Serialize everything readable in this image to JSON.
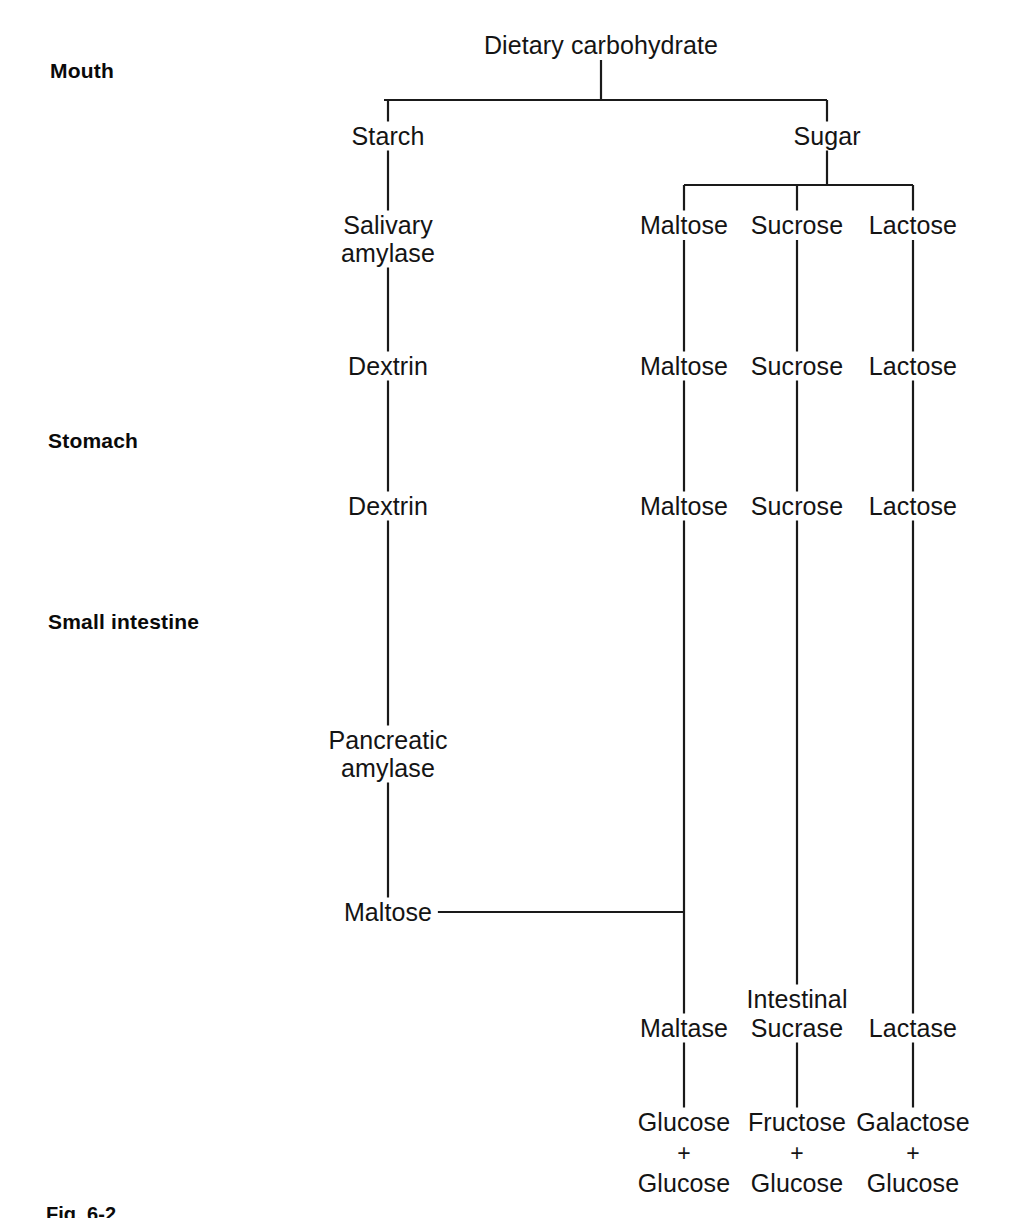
{
  "figure": {
    "caption": "Fig. 6-2"
  },
  "region_labels": [
    {
      "id": "mouth",
      "label": "Mouth",
      "x": 50,
      "y": 71
    },
    {
      "id": "stomach",
      "label": "Stomach",
      "x": 48,
      "y": 441
    },
    {
      "id": "small-intestine",
      "label": "Small intestine",
      "x": 48,
      "y": 622
    }
  ],
  "nodes": [
    {
      "id": "dietary-carbohydrate",
      "label": "Dietary carbohydrate",
      "x": 601,
      "y": 45
    },
    {
      "id": "starch",
      "label": "Starch",
      "x": 388,
      "y": 136
    },
    {
      "id": "sugar",
      "label": "Sugar",
      "x": 827,
      "y": 136
    },
    {
      "id": "salivary-amylase-1",
      "label": "Salivary",
      "x": 388,
      "y": 225
    },
    {
      "id": "salivary-amylase-2",
      "label": "amylase",
      "x": 388,
      "y": 253
    },
    {
      "id": "sugar-maltose-1",
      "label": "Maltose",
      "x": 684,
      "y": 225
    },
    {
      "id": "sugar-sucrose-1",
      "label": "Sucrose",
      "x": 797,
      "y": 225
    },
    {
      "id": "sugar-lactose-1",
      "label": "Lactose",
      "x": 913,
      "y": 225
    },
    {
      "id": "dextrin-1",
      "label": "Dextrin",
      "x": 388,
      "y": 366
    },
    {
      "id": "sugar-maltose-2",
      "label": "Maltose",
      "x": 684,
      "y": 366
    },
    {
      "id": "sugar-sucrose-2",
      "label": "Sucrose",
      "x": 797,
      "y": 366
    },
    {
      "id": "sugar-lactose-2",
      "label": "Lactose",
      "x": 913,
      "y": 366
    },
    {
      "id": "dextrin-2",
      "label": "Dextrin",
      "x": 388,
      "y": 506
    },
    {
      "id": "sugar-maltose-3",
      "label": "Maltose",
      "x": 684,
      "y": 506
    },
    {
      "id": "sugar-sucrose-3",
      "label": "Sucrose",
      "x": 797,
      "y": 506
    },
    {
      "id": "sugar-lactose-3",
      "label": "Lactose",
      "x": 913,
      "y": 506
    },
    {
      "id": "pancreatic-amylase-1",
      "label": "Pancreatic",
      "x": 388,
      "y": 740
    },
    {
      "id": "pancreatic-amylase-2",
      "label": "amylase",
      "x": 388,
      "y": 768
    },
    {
      "id": "maltose-product",
      "label": "Maltose",
      "x": 388,
      "y": 912
    },
    {
      "id": "intestinal",
      "label": "Intestinal",
      "x": 797,
      "y": 999
    },
    {
      "id": "maltase",
      "label": "Maltase",
      "x": 684,
      "y": 1028
    },
    {
      "id": "sucrase",
      "label": "Sucrase",
      "x": 797,
      "y": 1028
    },
    {
      "id": "lactase",
      "label": "Lactase",
      "x": 913,
      "y": 1028
    },
    {
      "id": "glucose-1",
      "label": "Glucose",
      "x": 684,
      "y": 1122
    },
    {
      "id": "fructose",
      "label": "Fructose",
      "x": 797,
      "y": 1122
    },
    {
      "id": "galactose",
      "label": "Galactose",
      "x": 913,
      "y": 1122
    },
    {
      "id": "glucose-2",
      "label": "Glucose",
      "x": 684,
      "y": 1183
    },
    {
      "id": "glucose-3",
      "label": "Glucose",
      "x": 797,
      "y": 1183
    },
    {
      "id": "glucose-4",
      "label": "Glucose",
      "x": 913,
      "y": 1183
    }
  ],
  "plus_signs": [
    {
      "id": "plus-maltase",
      "symbol": "+",
      "x": 684,
      "y": 1153
    },
    {
      "id": "plus-sucrase",
      "symbol": "+",
      "x": 797,
      "y": 1153
    },
    {
      "id": "plus-lactase",
      "symbol": "+",
      "x": 913,
      "y": 1153
    }
  ],
  "connectors": [
    {
      "id": "root-stem",
      "type": "v",
      "x": 601,
      "y1": 60,
      "y2": 100
    },
    {
      "id": "root-split-bar",
      "type": "h",
      "y": 100,
      "x1": 384,
      "x2": 827
    },
    {
      "id": "starch-drop",
      "type": "v",
      "x": 388,
      "y1": 100,
      "y2": 122
    },
    {
      "id": "sugar-drop",
      "type": "v",
      "x": 827,
      "y1": 100,
      "y2": 122
    },
    {
      "id": "starch-to-salivary",
      "type": "v",
      "x": 388,
      "y1": 150,
      "y2": 211
    },
    {
      "id": "salivary-to-dextrin",
      "type": "v",
      "x": 388,
      "y1": 266,
      "y2": 352
    },
    {
      "id": "dextrin1-to-dextrin2",
      "type": "v",
      "x": 388,
      "y1": 380,
      "y2": 492
    },
    {
      "id": "dextrin2-to-pancreatic",
      "type": "v",
      "x": 388,
      "y1": 520,
      "y2": 726
    },
    {
      "id": "pancreatic-to-maltose",
      "type": "v",
      "x": 388,
      "y1": 782,
      "y2": 898
    },
    {
      "id": "sugar-stem",
      "type": "v",
      "x": 827,
      "y1": 150,
      "y2": 185
    },
    {
      "id": "sugar-split-bar",
      "type": "h",
      "y": 185,
      "x1": 684,
      "x2": 913
    },
    {
      "id": "maltose-drop",
      "type": "v",
      "x": 684,
      "y1": 185,
      "y2": 211
    },
    {
      "id": "sucrose-drop",
      "type": "v",
      "x": 797,
      "y1": 185,
      "y2": 211
    },
    {
      "id": "lactose-drop",
      "type": "v",
      "x": 913,
      "y1": 185,
      "y2": 211
    },
    {
      "id": "maltose-1-to-2",
      "type": "v",
      "x": 684,
      "y1": 240,
      "y2": 352
    },
    {
      "id": "sucrose-1-to-2",
      "type": "v",
      "x": 797,
      "y1": 240,
      "y2": 352
    },
    {
      "id": "lactose-1-to-2",
      "type": "v",
      "x": 913,
      "y1": 240,
      "y2": 352
    },
    {
      "id": "maltose-2-to-3",
      "type": "v",
      "x": 684,
      "y1": 380,
      "y2": 492
    },
    {
      "id": "sucrose-2-to-3",
      "type": "v",
      "x": 797,
      "y1": 380,
      "y2": 492
    },
    {
      "id": "lactose-2-to-3",
      "type": "v",
      "x": 913,
      "y1": 380,
      "y2": 492
    },
    {
      "id": "maltose-3-to-maltase",
      "type": "v",
      "x": 684,
      "y1": 520,
      "y2": 1014
    },
    {
      "id": "sucrose-3-to-sucrase",
      "type": "v",
      "x": 797,
      "y1": 520,
      "y2": 985
    },
    {
      "id": "lactose-3-to-lactase",
      "type": "v",
      "x": 913,
      "y1": 520,
      "y2": 1014
    },
    {
      "id": "maltose-product-join",
      "type": "h",
      "y": 912,
      "x1": 437,
      "x2": 685
    },
    {
      "id": "maltase-to-glucose",
      "type": "v",
      "x": 684,
      "y1": 1042,
      "y2": 1108
    },
    {
      "id": "sucrase-to-fructose",
      "type": "v",
      "x": 797,
      "y1": 1042,
      "y2": 1108
    },
    {
      "id": "lactase-to-galactose",
      "type": "v",
      "x": 913,
      "y1": 1042,
      "y2": 1108
    }
  ],
  "chart_data": {
    "type": "diagram",
    "pathways": [
      {
        "name": "Starch pathway",
        "stages": [
          {
            "region": "Mouth",
            "substrate": "Starch",
            "enzyme": "Salivary amylase",
            "product": "Dextrin"
          },
          {
            "region": "Stomach",
            "substrate": "Dextrin",
            "enzyme": "",
            "product": "Dextrin"
          },
          {
            "region": "Small intestine",
            "substrate": "Dextrin",
            "enzyme": "Pancreatic amylase",
            "product": "Maltose"
          }
        ]
      },
      {
        "name": "Maltose pathway",
        "stages": [
          {
            "region": "Mouth",
            "substrate": "Maltose",
            "enzyme": "",
            "product": "Maltose"
          },
          {
            "region": "Stomach",
            "substrate": "Maltose",
            "enzyme": "",
            "product": "Maltose"
          },
          {
            "region": "Small intestine",
            "substrate": "Maltose",
            "enzyme": "Maltase",
            "product": "Glucose + Glucose"
          }
        ]
      },
      {
        "name": "Sucrose pathway",
        "stages": [
          {
            "region": "Mouth",
            "substrate": "Sucrose",
            "enzyme": "",
            "product": "Sucrose"
          },
          {
            "region": "Stomach",
            "substrate": "Sucrose",
            "enzyme": "",
            "product": "Sucrose"
          },
          {
            "region": "Small intestine",
            "substrate": "Sucrose",
            "enzyme": "Intestinal Sucrase",
            "product": "Fructose + Glucose"
          }
        ]
      },
      {
        "name": "Lactose pathway",
        "stages": [
          {
            "region": "Mouth",
            "substrate": "Lactose",
            "enzyme": "",
            "product": "Lactose"
          },
          {
            "region": "Stomach",
            "substrate": "Lactose",
            "enzyme": "",
            "product": "Lactose"
          },
          {
            "region": "Small intestine",
            "substrate": "Lactose",
            "enzyme": "Lactase",
            "product": "Galactose + Glucose"
          }
        ]
      }
    ],
    "root": "Dietary carbohydrate",
    "root_children": [
      "Starch",
      "Sugar"
    ],
    "sugar_children": [
      "Maltose",
      "Sucrose",
      "Lactose"
    ]
  }
}
